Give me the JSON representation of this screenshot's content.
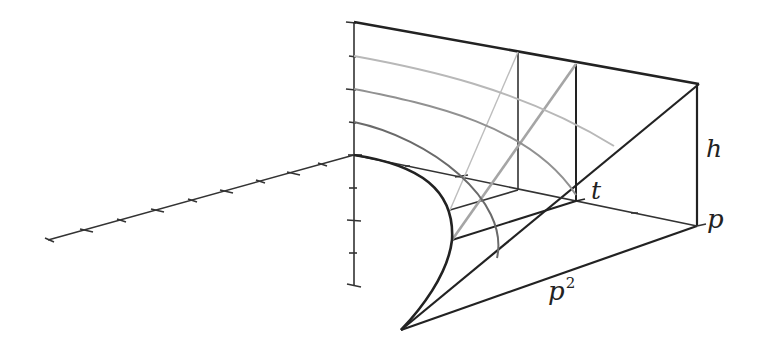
{
  "figure": {
    "type": "3D geometric diagram",
    "colors": {
      "background": "#ffffff",
      "primary_line": "#222222",
      "gray_dark": "#666666",
      "gray_mid": "#909090",
      "gray_light": "#b4b4b4"
    }
  },
  "labels": {
    "h": "h",
    "t": "t",
    "p": "p",
    "p_squared_base": "p",
    "p_squared_exp": "2"
  },
  "axes": {
    "left_axis_ticks": 11,
    "vertical_axis_ticks_above": 4,
    "vertical_axis_ticks_below": 4
  }
}
